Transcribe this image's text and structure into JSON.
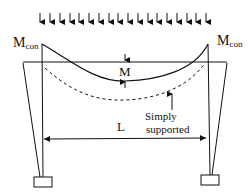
{
  "labels": {
    "m_con_left": "M",
    "m_con_left_sub": "con",
    "m_con_right": "M",
    "m_con_right_sub": "con",
    "midspan_moment": "M",
    "simply_supported_line1": "Simply",
    "simply_supported_line2": "supported",
    "span": "L"
  },
  "load": {
    "type": "uniformly distributed load",
    "arrow_count": 18
  },
  "colors": {
    "ink": "#111111",
    "background": "#ffffff"
  }
}
